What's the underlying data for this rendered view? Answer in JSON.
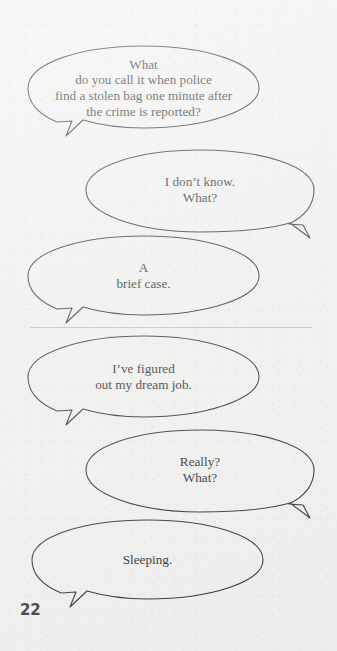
{
  "page": {
    "number": "22",
    "background_color": "#f1f1f0",
    "ink_color": "#2a2a2a",
    "divider_color": "#bdbdbd"
  },
  "panels": [
    {
      "id": "panel-top",
      "bubbles": [
        {
          "id": "bubble-1",
          "speaker_side": "left",
          "tail": "bottom-left",
          "lines": [
            "What",
            "do you call it when police",
            "find a stolen bag one minute after",
            "the crime is reported?"
          ]
        },
        {
          "id": "bubble-2",
          "speaker_side": "right",
          "tail": "bottom-right",
          "lines": [
            "I don’t know.",
            "What?"
          ]
        },
        {
          "id": "bubble-3",
          "speaker_side": "left",
          "tail": "bottom-left",
          "lines": [
            "A",
            "brief case."
          ]
        }
      ]
    },
    {
      "id": "panel-bottom",
      "bubbles": [
        {
          "id": "bubble-4",
          "speaker_side": "left",
          "tail": "bottom-left",
          "lines": [
            "I’ve figured",
            "out my dream job."
          ]
        },
        {
          "id": "bubble-5",
          "speaker_side": "right",
          "tail": "bottom-right",
          "lines": [
            "Really?",
            "What?"
          ]
        },
        {
          "id": "bubble-6",
          "speaker_side": "left",
          "tail": "bottom-left",
          "lines": [
            "Sleeping."
          ]
        }
      ]
    }
  ]
}
